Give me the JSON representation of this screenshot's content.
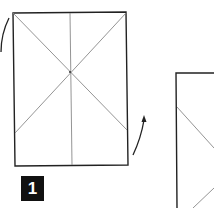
{
  "diagram": {
    "type": "origami-folding-instructions",
    "steps": [
      {
        "label": "1",
        "shape": "rectangle-sheet",
        "crease_lines": [
          "vertical-center",
          "diagonal-top-left-to-right",
          "diagonal-top-right-to-left"
        ],
        "arrows": [
          "curved-arrow-left",
          "curved-arrow-right-up"
        ]
      },
      {
        "label": "",
        "shape": "rectangle-sheet-partial",
        "crease_lines": [
          "diagonal",
          "lower-diagonal"
        ]
      }
    ],
    "colors": {
      "line": "#222222",
      "crease": "#888888",
      "label_bg": "#111111",
      "label_text": "#ffffff"
    }
  }
}
